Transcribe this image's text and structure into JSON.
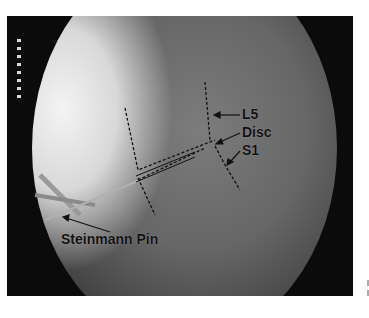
{
  "image": {
    "type": "fluoroscopy",
    "description": "Intraoperative lateral fluoroscopic view of lumbosacral junction with Steinmann pin"
  },
  "labels": {
    "l5": "L5",
    "disc": "Disc",
    "s1": "S1",
    "pin": "Steinmann Pin"
  },
  "colors": {
    "background": "#0b0b0b",
    "label": "#111111",
    "page": "#ffffff"
  }
}
